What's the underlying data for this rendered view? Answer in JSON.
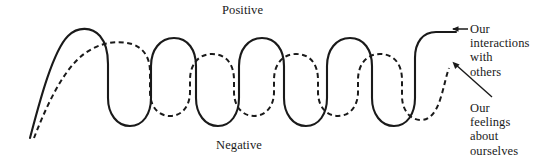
{
  "figure": {
    "type": "line-diagram",
    "axis_labels": {
      "top": "Positive",
      "bottom": "Negative"
    },
    "annotations": [
      {
        "id": "interactions",
        "lines": [
          "Our",
          "interactions",
          "with",
          "others"
        ],
        "pointer": "left-arrow",
        "target": "solid-wave"
      },
      {
        "id": "feelings",
        "lines": [
          "Our",
          "feelings",
          "about",
          "ourselves"
        ],
        "pointer": "diagonal-arrow",
        "target": "dashed-wave"
      }
    ],
    "series": [
      {
        "name": "Our interactions with others",
        "style": "solid",
        "color": "#1a1a1a",
        "width": 2.1
      },
      {
        "name": "Our feelings about ourselves",
        "style": "dashed",
        "color": "#1a1a1a",
        "width": 2.0,
        "dash": "5,3.5"
      }
    ]
  },
  "chart_data": {
    "type": "line",
    "title": "",
    "xlabel": "",
    "ylabel": "",
    "grid": false,
    "legend": "annotations-right",
    "ylim": [
      0,
      100
    ],
    "y_axis_ticks": [
      "Negative",
      "Positive"
    ],
    "series": [
      {
        "name": "Our interactions with others",
        "style": "solid",
        "x": [
          30,
          78,
          120,
          132,
          152,
          182,
          205,
          228,
          252,
          285,
          305,
          330,
          352,
          382,
          400,
          420,
          455
        ],
        "y": [
          8,
          92,
          88,
          28,
          10,
          10,
          92,
          92,
          12,
          10,
          92,
          92,
          12,
          10,
          90,
          92,
          92
        ]
      },
      {
        "name": "Our feelings about ourselves",
        "style": "dashed",
        "x": [
          34,
          100,
          140,
          160,
          175,
          198,
          222,
          252,
          272,
          295,
          318,
          345,
          368,
          392,
          412,
          438,
          455
        ],
        "y": [
          8,
          78,
          80,
          40,
          28,
          28,
          76,
          76,
          30,
          28,
          76,
          76,
          30,
          28,
          70,
          30,
          24
        ]
      }
    ]
  },
  "geometry": {
    "solid_path": "M 30 138 C 38 108, 52 52, 68 36 C 78 26, 92 27, 100 36 C 106 43, 108 52, 108 64 L 108 98 C 108 114, 117 126, 130 126 C 143 126, 151 114, 151 98 L 151 66 C 151 50, 160 38, 174 38 C 188 38, 196 50, 196 66 L 196 98 C 196 114, 205 126, 218 126 C 231 126, 239 114, 239 98 L 239 66 C 239 50, 248 38, 262 38 C 276 38, 284 50, 284 66 L 284 98 C 284 114, 293 126, 306 126 C 319 126, 327 114, 327 98 L 327 66 C 327 50, 336 38, 350 38 C 364 38, 372 50, 372 66 L 372 98 C 372 114, 381 126, 394 126 C 407 126, 415 114, 415 98 L 415 58 C 415 42, 423 32, 436 32 L 456 32",
    "dashed_path": "M 34 138 C 44 112, 62 70, 84 54 C 100 42, 118 40, 132 44 C 144 48, 150 58, 150 72 L 150 92 C 150 106, 158 116, 170 116 C 182 116, 190 106, 190 92 L 190 80 C 190 64, 199 54, 212 54 C 226 54, 234 64, 234 80 L 234 92 C 234 106, 242 116, 254 116 C 266 116, 274 106, 274 92 L 274 80 C 274 64, 283 54, 296 54 C 310 54, 318 64, 318 80 L 318 92 C 318 106, 326 116, 338 116 C 350 116, 358 106, 358 92 L 358 80 C 358 64, 367 54, 380 54 C 394 54, 402 64, 402 80 L 402 96 C 402 110, 410 120, 421 120 C 430 120, 436 112, 440 100 C 444 88, 446 76, 449 68",
    "arrow_left": {
      "x1": 468,
      "y1": 29,
      "x2": 452,
      "y2": 29
    },
    "arrow_diagonal": {
      "x1": 492,
      "y1": 97,
      "x2": 452,
      "y2": 62
    }
  }
}
